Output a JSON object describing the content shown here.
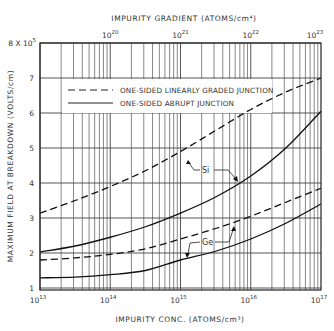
{
  "chart_data": {
    "type": "line",
    "title": "",
    "xlabel": "IMPURITY CONC. (ATOMS/cm³)",
    "x2label": "IMPURITY GRADIENT (ATOMS/cm⁴)",
    "ylabel": "MAXIMUM FIELD AT BREAKDOWN (VOLTS/cm)",
    "x_scale": "log",
    "xlim": [
      10000000000000.0,
      1e+17
    ],
    "x_ticks": [
      {
        "base": "10",
        "exp": "13"
      },
      {
        "base": "10",
        "exp": "14"
      },
      {
        "base": "10",
        "exp": "15"
      },
      {
        "base": "10",
        "exp": "16"
      },
      {
        "base": "10",
        "exp": "17"
      }
    ],
    "x2lim": [
      1e+19,
      1e+23
    ],
    "x2_ticks": [
      {
        "base": "10",
        "exp": "20"
      },
      {
        "base": "10",
        "exp": "21"
      },
      {
        "base": "10",
        "exp": "22"
      },
      {
        "base": "10",
        "exp": "23"
      }
    ],
    "ylim": [
      1,
      8
    ],
    "y_ticks": [
      "1",
      "2",
      "3",
      "4",
      "5",
      "6",
      "7"
    ],
    "y_top_label": {
      "prefix": "8 X 10",
      "exp": "5"
    },
    "y_unit_multiplier": 100000,
    "grid": true,
    "legend": {
      "position": "upper-left",
      "entries": [
        {
          "label": "ONE-SIDED LINEARLY GRADED JUNCTION",
          "style": "dashed"
        },
        {
          "label": "ONE-SIDED ABRUPT JUNCTION",
          "style": "solid"
        }
      ]
    },
    "series": [
      {
        "name": "Si – linearly graded",
        "material": "Si",
        "style": "dashed",
        "x_log": [
          13,
          13.5,
          14,
          14.5,
          15,
          15.5,
          16,
          16.5,
          17
        ],
        "values": [
          3.14,
          3.5,
          3.9,
          4.35,
          4.9,
          5.5,
          6.1,
          6.6,
          7.0
        ]
      },
      {
        "name": "Si – abrupt",
        "material": "Si",
        "style": "solid",
        "x_log": [
          13,
          13.5,
          14,
          14.5,
          15,
          15.5,
          16,
          16.5,
          17
        ],
        "values": [
          2.03,
          2.2,
          2.45,
          2.75,
          3.14,
          3.6,
          4.2,
          5.0,
          6.05
        ]
      },
      {
        "name": "Ge – linearly graded",
        "material": "Ge",
        "style": "dashed",
        "x_log": [
          13,
          13.5,
          14,
          14.5,
          15,
          15.5,
          16,
          16.5,
          17
        ],
        "values": [
          1.8,
          1.86,
          1.96,
          2.12,
          2.4,
          2.7,
          3.05,
          3.45,
          3.85
        ]
      },
      {
        "name": "Ge – abrupt",
        "material": "Ge",
        "style": "solid",
        "x_log": [
          13,
          13.5,
          14,
          14.5,
          15,
          15.5,
          16,
          16.5,
          17
        ],
        "values": [
          1.29,
          1.31,
          1.38,
          1.5,
          1.8,
          2.05,
          2.4,
          2.85,
          3.4
        ]
      }
    ],
    "annotations": [
      {
        "text": "Si",
        "x_log": 15.32,
        "y": 4.5
      },
      {
        "text": "Ge",
        "x_log": 15.33,
        "y": 2.3
      }
    ]
  }
}
